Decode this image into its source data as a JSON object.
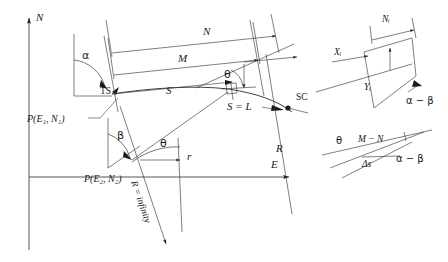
{
  "figure": {
    "axes": {
      "north_label": "N",
      "east_label": "E"
    },
    "main": {
      "angle_alpha": "α",
      "angle_beta": "β",
      "angle_theta": "θ",
      "angle_theta_lower": "θ",
      "point_ts": "TS",
      "point_sc": "SC",
      "dim_m": "M",
      "dim_n": "N",
      "chord_s": "S",
      "arc_equals_l": "S = L",
      "radius_label": "R",
      "radius_infinity": "R = infinity",
      "tangent_r": "r",
      "point_p1": "P(E₁, N₁)",
      "point_p2": "P(E₂, N₂)"
    },
    "inset_top_right": {
      "x_label": "Xᵢ",
      "y_label": "Yᵢ",
      "n_label": "Nᵢ",
      "angle": "α − β"
    },
    "inset_bottom_right": {
      "theta": "θ",
      "m_minus_n": "M − N",
      "delta_s": "Δs",
      "angle": "α − β"
    }
  },
  "colors": {
    "ink": "#1a1a1a",
    "line": "#2b2b2b",
    "background": "#ffffff"
  }
}
